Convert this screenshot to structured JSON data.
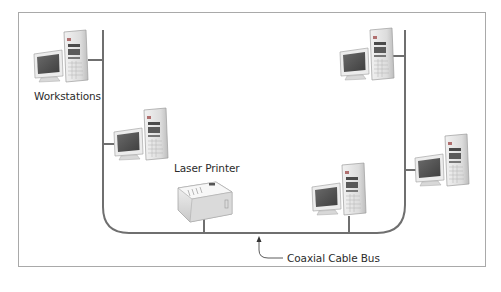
{
  "diagram": {
    "labels": {
      "workstations": "Workstations",
      "printer": "Laser Printer",
      "bus": "Coaxial Cable Bus"
    },
    "nodes": [
      {
        "id": "ws1",
        "type": "workstation",
        "x": 32,
        "y": 30
      },
      {
        "id": "ws2",
        "type": "workstation",
        "x": 112,
        "y": 108
      },
      {
        "id": "printer",
        "type": "laser-printer",
        "x": 176,
        "y": 178
      },
      {
        "id": "ws3",
        "type": "workstation",
        "x": 310,
        "y": 163
      },
      {
        "id": "ws4",
        "type": "workstation",
        "x": 338,
        "y": 28
      },
      {
        "id": "ws5",
        "type": "workstation",
        "x": 413,
        "y": 134
      }
    ],
    "colors": {
      "bus_line": "#6f6f6f",
      "frame": "#a9a9a9",
      "text": "#2b2b2b"
    }
  }
}
